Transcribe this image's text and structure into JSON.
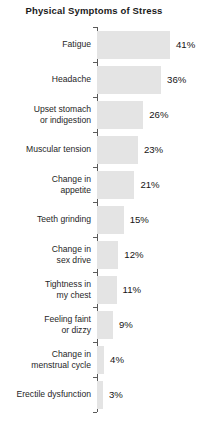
{
  "chart_data": {
    "type": "bar",
    "orientation": "horizontal",
    "title": "Physical Symptoms of Stress",
    "xlabel": "",
    "ylabel": "",
    "xlim": [
      0,
      45
    ],
    "grid": false,
    "legend": null,
    "value_suffix": "%",
    "bar_color": "#e4e4e4",
    "axis_color": "#5a5a5a",
    "text_color": "#262626",
    "categories": [
      "Fatigue",
      "Headache",
      "Upset stomach\nor indigestion",
      "Muscular tension",
      "Change in\nappetite",
      "Teeth grinding",
      "Change in\nsex drive",
      "Tightness in\nmy chest",
      "Feeling faint\nor dizzy",
      "Change in\nmenstrual cycle",
      "Erectile dysfunction"
    ],
    "values": [
      41,
      36,
      26,
      23,
      21,
      15,
      12,
      11,
      9,
      4,
      3
    ],
    "value_labels": [
      "41%",
      "36%",
      "26%",
      "23%",
      "21%",
      "15%",
      "12%",
      "11%",
      "9%",
      "4%",
      "3%"
    ]
  }
}
